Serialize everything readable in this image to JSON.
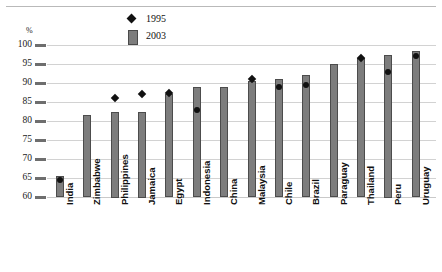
{
  "axis": {
    "unit_label": "%",
    "y_ticks": [
      100,
      95,
      90,
      85,
      80,
      75,
      70,
      65,
      60
    ]
  },
  "legend": {
    "items": [
      {
        "label": "1995",
        "marker": "diamond",
        "color": "#111111"
      },
      {
        "label": "2003",
        "marker": "bar",
        "color": "#7d7d7d"
      }
    ]
  },
  "chart_data": {
    "type": "bar",
    "title": "",
    "subtitle": "",
    "xlabel": "",
    "ylabel": "%",
    "ylim": [
      60,
      100
    ],
    "ytick_step": 5,
    "grid": true,
    "legend_position": "top-left",
    "annotations": [],
    "categories": [
      "India",
      "Zimbabwe",
      "Philippines",
      "Jamaica",
      "Egypt",
      "Indonesia",
      "China",
      "Malaysia",
      "Chile",
      "Brazil",
      "Paraguay",
      "Thailand",
      "Peru",
      "Uruguay"
    ],
    "series": [
      {
        "name": "2003",
        "type": "bar",
        "color": "#7d7d7d",
        "values": [
          65.5,
          81.5,
          82.5,
          82.5,
          87,
          89,
          89,
          90.5,
          91,
          92,
          95,
          96.5,
          97.5,
          98.5
        ]
      },
      {
        "name": "1995",
        "type": "scatter",
        "color": "#111111",
        "values": [
          64.5,
          null,
          86,
          87,
          87.5,
          83,
          null,
          91,
          89,
          89.5,
          null,
          96.5,
          93,
          97
        ]
      }
    ]
  }
}
